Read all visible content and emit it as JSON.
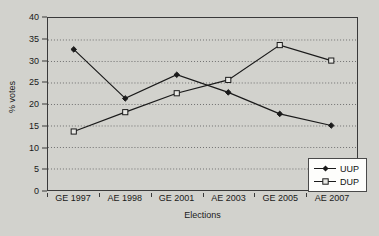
{
  "chart_data": {
    "type": "line",
    "title": "",
    "xlabel": "Elections",
    "ylabel": "% votes",
    "categories": [
      "GE 1997",
      "AE 1998",
      "GE 2001",
      "AE 2003",
      "GE 2005",
      "AE 2007"
    ],
    "series": [
      {
        "name": "UUP",
        "marker": "filled-diamond",
        "color": "#1a1a1a",
        "values": [
          32.7,
          21.3,
          26.8,
          22.7,
          17.7,
          15.0
        ]
      },
      {
        "name": "DUP",
        "marker": "open-square",
        "color": "#1a1a1a",
        "values": [
          13.6,
          18.1,
          22.5,
          25.6,
          33.7,
          30.1
        ]
      }
    ],
    "ylim": [
      0,
      40
    ],
    "yticks": [
      0,
      5,
      10,
      15,
      20,
      25,
      30,
      35,
      40
    ],
    "ytick_labels": [
      "0",
      "5",
      "10",
      "15",
      "20",
      "25",
      "30",
      "35",
      "40"
    ],
    "grid": "horizontal-dotted",
    "legend_position": "bottom-right",
    "background_color": "#d2d2cd",
    "axis_color": "#3a3a3a",
    "grid_color": "#6e6e6e"
  }
}
